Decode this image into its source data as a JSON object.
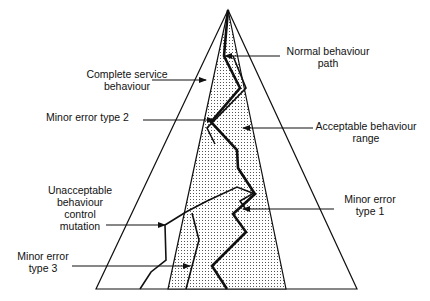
{
  "diagram": {
    "labels": {
      "complete_service_1": "Complete service",
      "complete_service_2": "behaviour",
      "normal_path_1": "Normal behaviour",
      "normal_path_2": "path",
      "minor_error_2": "Minor error type 2",
      "acceptable_range_1": "Acceptable behaviour",
      "acceptable_range_2": "range",
      "unacceptable_1": "Unacceptable",
      "unacceptable_2": "behaviour",
      "unacceptable_3": "control",
      "unacceptable_4": "mutation",
      "minor_error_1_a": "Minor error",
      "minor_error_1_b": "type 1",
      "minor_error_3_a": "Minor error",
      "minor_error_3_b": "type 3"
    },
    "colors": {
      "line": "#111111",
      "shade_dot": "#555555",
      "background": "#ffffff"
    }
  }
}
